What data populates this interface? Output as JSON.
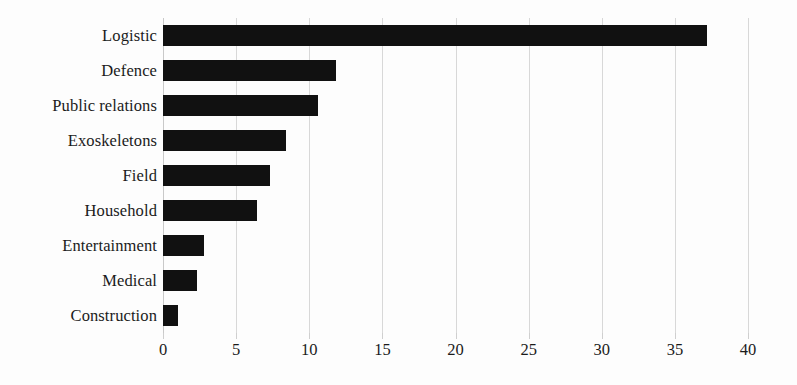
{
  "chart_data": {
    "type": "bar",
    "orientation": "horizontal",
    "title": "",
    "xlabel": "",
    "ylabel": "",
    "xlim": [
      0,
      40
    ],
    "xticks": [
      "0",
      "5",
      "10",
      "15",
      "20",
      "25",
      "30",
      "35",
      "40"
    ],
    "xtick_values": [
      0,
      5,
      10,
      15,
      20,
      25,
      30,
      35,
      40
    ],
    "grid": true,
    "grid_axis": "x",
    "legend": "none",
    "bar_color": "#111111",
    "grid_color": "#d8d8d8",
    "background_color": "#fdfdfd",
    "text_color": "#1b1b1b",
    "categories": [
      "Logistic",
      "Defence",
      "Public relations",
      "Exoskeletons",
      "Field",
      "Household",
      "Entertainment",
      "Medical",
      "Construction"
    ],
    "values": [
      37.2,
      11.8,
      10.6,
      8.4,
      7.3,
      6.4,
      2.8,
      2.3,
      1.0
    ]
  }
}
